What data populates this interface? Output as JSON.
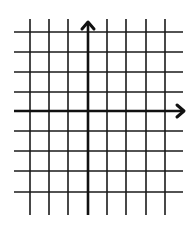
{
  "diagram": {
    "type": "coordinate-grid",
    "background": "#ffffff",
    "line_color": "#1a1a1a",
    "axis_color": "#111111",
    "grid_line_width": 1.6,
    "axis_line_width": 2.6,
    "vertical_lines_x": [
      30,
      49,
      68,
      107,
      126,
      146,
      165
    ],
    "vertical_top": 19,
    "vertical_bottom": 215,
    "horizontal_lines_y": [
      32,
      52,
      72,
      92,
      131,
      151,
      171,
      192
    ],
    "horizontal_left": 14,
    "horizontal_right": 183,
    "y_axis": {
      "x": 88,
      "top": 22,
      "bottom": 215,
      "arrow": "up"
    },
    "x_axis": {
      "y": 111,
      "left": 14,
      "right": 184,
      "arrow": "right"
    }
  }
}
